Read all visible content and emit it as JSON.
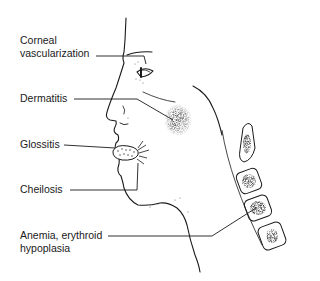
{
  "diagram": {
    "labels": [
      {
        "id": "corneal",
        "line1": "Corneal",
        "line2": "vascularization"
      },
      {
        "id": "dermatitis",
        "line1": "Dermatitis"
      },
      {
        "id": "glossitis",
        "line1": "Glossitis"
      },
      {
        "id": "cheilosis",
        "line1": "Cheilosis"
      },
      {
        "id": "anemia",
        "line1": "Anemia, erythroid",
        "line2": "hypoplasia"
      }
    ],
    "illustration": "side-profile-face-with-cervical-vertebrae",
    "colors": {
      "ink": "#1a1a1a",
      "background": "#ffffff"
    }
  }
}
